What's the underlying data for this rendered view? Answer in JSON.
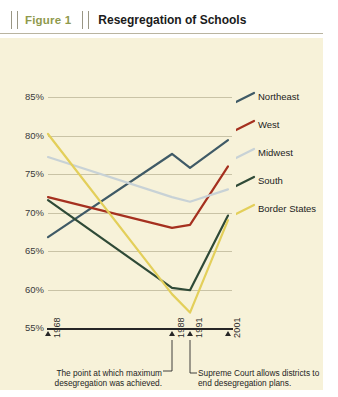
{
  "header": {
    "figure_number": "Figure 1",
    "title": "Resegregation of Schools"
  },
  "annotations": {
    "left": "The point at which maximum desegregation was achieved.",
    "right": "Supreme Court allows districts to end desegregation plans."
  },
  "colors": {
    "panel_background": "#f7f2d9",
    "page_background": "#ffffff",
    "gridline": "#c9c3a6",
    "axis": "#262626",
    "figure_number_accent": "#8f9a4d",
    "northeast": "#3f5a66",
    "west": "#a5301f",
    "midwest": "#c8d2d6",
    "south": "#2f4a37",
    "border_states": "#e3cf5a"
  },
  "chart_data": {
    "type": "line",
    "title": "Resegregation of Schools",
    "xlabel": "",
    "ylabel": "",
    "x": [
      1968,
      1988,
      1991,
      2001
    ],
    "xtick_labels": [
      "1968",
      "1988",
      "1991",
      "2001"
    ],
    "ytick_labels": [
      "85%",
      "80%",
      "75%",
      "70%",
      "65%",
      "60%",
      "55%"
    ],
    "ylim": [
      55,
      85
    ],
    "ytick_values": [
      85,
      80,
      75,
      70,
      65,
      60,
      55
    ],
    "grid": true,
    "legend_position": "right",
    "series": [
      {
        "name": "Northeast",
        "color": "#3f5a66",
        "values": [
          66.8,
          77.6,
          75.8,
          79.4
        ]
      },
      {
        "name": "West",
        "color": "#a5301f",
        "values": [
          72.0,
          68.0,
          68.4,
          76.0
        ]
      },
      {
        "name": "Midwest",
        "color": "#c8d2d6",
        "values": [
          77.2,
          72.0,
          71.4,
          73.0
        ]
      },
      {
        "name": "South",
        "color": "#2f4a37",
        "values": [
          71.6,
          60.2,
          59.9,
          69.6
        ]
      },
      {
        "name": "Border States",
        "color": "#e3cf5a",
        "values": [
          80.2,
          59.4,
          57.0,
          69.0
        ]
      }
    ]
  }
}
